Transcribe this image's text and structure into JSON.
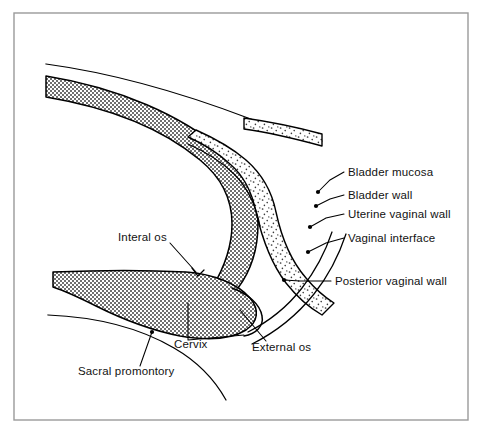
{
  "figure": {
    "kind": "anatomical-line-diagram",
    "background_color": "#ffffff",
    "frame": {
      "stroke_color": "#9a9a9a",
      "x": 14,
      "y": 13,
      "width": 454,
      "height": 407
    },
    "ink_color": "#000000",
    "fills": {
      "uterine_wall_label": "dense-checker-stipple",
      "uterine_wall_tone": "#808080",
      "bladder_wall_label": "sparse-dot-stipple",
      "bladder_wall_tone": "#d9d9d9"
    }
  },
  "labels": {
    "right_column": [
      {
        "id": "bladder-mucosa",
        "text": "Bladder mucosa",
        "text_x": 348,
        "text_y": 176,
        "leader": "M 344 172 L 330 180 L 318 192",
        "dot_x": 318,
        "dot_y": 192
      },
      {
        "id": "bladder-wall",
        "text": "Bladder wall",
        "text_x": 348,
        "text_y": 199,
        "leader": "M 344 195 L 330 199 L 316 206",
        "dot_x": 316,
        "dot_y": 206
      },
      {
        "id": "uterine-vaginal-wall",
        "text": "Uterine vaginal wall",
        "text_x": 348,
        "text_y": 218,
        "leader": "M 344 214 L 326 218 L 310 227",
        "dot_x": 310,
        "dot_y": 227
      },
      {
        "id": "vaginal-interface",
        "text": "Vaginal interface",
        "text_x": 348,
        "text_y": 242,
        "leader": "M 344 238 L 326 243 L 308 252",
        "dot_x": 308,
        "dot_y": 252
      },
      {
        "id": "posterior-vaginal-wall",
        "text": "Posterior vaginal wall",
        "text_x": 335,
        "text_y": 285,
        "leader": "M 331 281 L 300 281 L 284 280",
        "dot_x": 284,
        "dot_y": 280
      }
    ],
    "left_column": [
      {
        "id": "interal-os",
        "text": "Interal os",
        "text_x": 118,
        "text_y": 241,
        "leader": "M 170 243 L 196 272",
        "dot_x": 196,
        "dot_y": 272
      },
      {
        "id": "cervix",
        "text": "Cervix",
        "text_x": 174,
        "text_y": 348,
        "bracket": "M 188 340 L 188 303 M 188 340 L 244 335"
      },
      {
        "id": "external-os",
        "text": "External os",
        "text_x": 252,
        "text_y": 351,
        "leader": "M 266 341 L 240 310",
        "dot_x": 240,
        "dot_y": 310
      },
      {
        "id": "sacral-promontory",
        "text": "Sacral promontory",
        "text_x": 78,
        "text_y": 375,
        "leader": "M 140 366 L 152 332",
        "dot_x": 152,
        "dot_y": 332
      }
    ]
  },
  "structures": [
    {
      "id": "abdominal-contour",
      "name": "Anterior abdominal contour line"
    },
    {
      "id": "uterine-body-band",
      "name": "Uterine wall band (dense stipple)"
    },
    {
      "id": "bladder-wall-band",
      "name": "Bladder wall band (sparse stipple)"
    },
    {
      "id": "cervix-mass",
      "name": "Cervix / lower uterine segment mass"
    },
    {
      "id": "posterior-vaginal-wall-band",
      "name": "Posterior vaginal wall (open band)"
    },
    {
      "id": "sacral-curve",
      "name": "Sacral promontory curve"
    }
  ]
}
